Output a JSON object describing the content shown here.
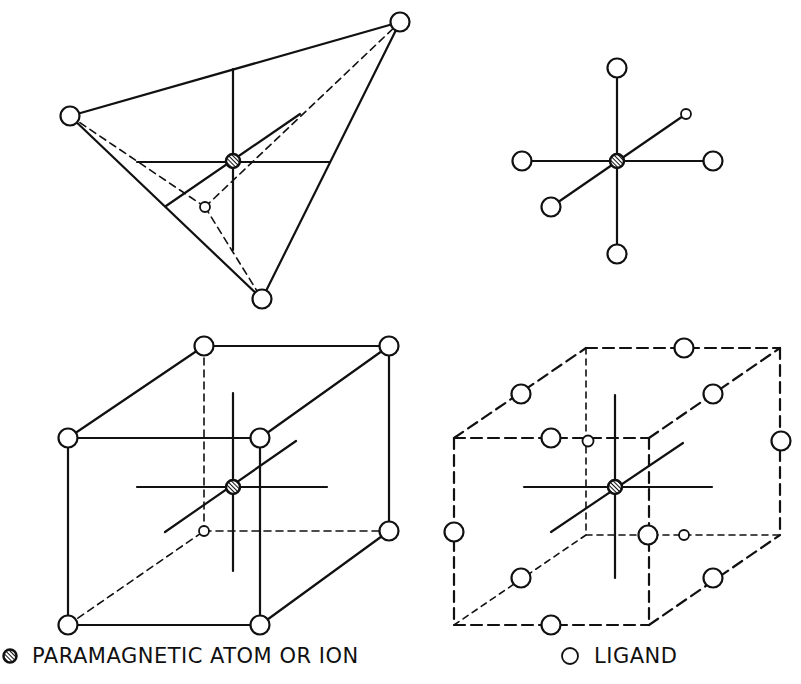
{
  "figure": {
    "panels": [
      {
        "id": "tetrahedral",
        "label": "Tetrahedral coordination (4 ligands)"
      },
      {
        "id": "octahedral",
        "label": "Octahedral coordination (6 ligands)"
      },
      {
        "id": "cubic",
        "label": "Cubic coordination (8 ligands)"
      },
      {
        "id": "cuboctahedral",
        "label": "12-ligand coordination at cube edge midpoints"
      }
    ]
  },
  "legend": {
    "atom_label": "PARAMAGNETIC ATOM OR ION",
    "ligand_label": "LIGAND"
  },
  "colors": {
    "line": "#111111",
    "background": "#ffffff"
  }
}
